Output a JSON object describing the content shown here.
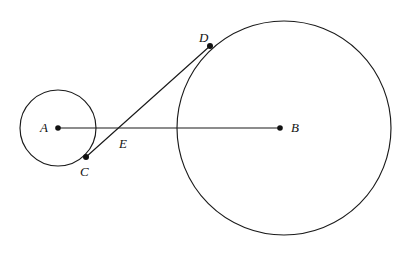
{
  "figure": {
    "width": 417,
    "height": 254,
    "background_color": "#ffffff",
    "stroke_color": "#1a1a1a",
    "dot_color": "#111111"
  },
  "chart_data": {
    "type": "diagram",
    "xlabel": "",
    "ylabel": "",
    "xlim": [
      0,
      417
    ],
    "ylim": [
      0,
      254
    ],
    "grid": false,
    "legend": null,
    "shapes": [
      {
        "kind": "circle",
        "name": "small-circle",
        "center": [
          58,
          128
        ],
        "radius": 38,
        "center_label": "A",
        "filled": false
      },
      {
        "kind": "circle",
        "name": "large-circle",
        "center": [
          284,
          128
        ],
        "radius": 107,
        "center_label": "B",
        "filled": false
      },
      {
        "kind": "segment",
        "name": "segment-AB",
        "from": [
          58,
          128
        ],
        "to": [
          280,
          128
        ],
        "endpoints": [
          "A",
          "B"
        ]
      },
      {
        "kind": "segment",
        "name": "segment-CD",
        "from": [
          86,
          157
        ],
        "to": [
          210,
          46
        ],
        "endpoints": [
          "C",
          "D"
        ],
        "passes_through": [
          "E"
        ]
      }
    ],
    "points": [
      {
        "label": "A",
        "x": 58,
        "y": 128,
        "dot": true,
        "label_x": 44,
        "label_y": 128,
        "role": "center-of-small-circle"
      },
      {
        "label": "B",
        "x": 280,
        "y": 128,
        "dot": true,
        "label_x": 295,
        "label_y": 128,
        "role": "center-of-large-circle"
      },
      {
        "label": "C",
        "x": 86,
        "y": 157,
        "dot": true,
        "label_x": 85,
        "label_y": 173,
        "role": "point-on-small-circle"
      },
      {
        "label": "D",
        "x": 210,
        "y": 46,
        "dot": true,
        "label_x": 204,
        "label_y": 38,
        "role": "point-on-large-circle"
      },
      {
        "label": "E",
        "x": 123,
        "y": 128,
        "dot": false,
        "label_x": 124,
        "label_y": 144,
        "role": "intersection-of-AB-and-CD"
      }
    ]
  },
  "labels": {
    "a": "A",
    "b": "B",
    "c": "C",
    "d": "D",
    "e": "E"
  }
}
